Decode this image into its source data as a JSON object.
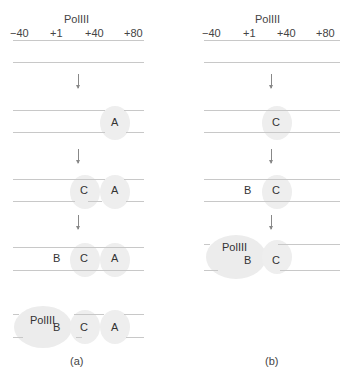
{
  "panels": [
    {
      "id": "a",
      "title": "PolIII",
      "ticks": [
        "−40",
        "+1",
        "+40",
        "+80"
      ],
      "caption": "(a)",
      "steps": [
        {
          "factors": []
        },
        {
          "factors": [
            "A"
          ]
        },
        {
          "factors": [
            "C",
            "A"
          ]
        },
        {
          "factors": [
            "B",
            "C",
            "A"
          ]
        },
        {
          "factors": [
            "PolIII",
            "B",
            "C",
            "A"
          ]
        }
      ]
    },
    {
      "id": "b",
      "title": "PolIII",
      "ticks": [
        "−40",
        "+1",
        "+40",
        "+80"
      ],
      "caption": "(b)",
      "steps": [
        {
          "factors": []
        },
        {
          "factors": [
            "C"
          ]
        },
        {
          "factors": [
            "B",
            "C"
          ]
        },
        {
          "factors": [
            "PolIII",
            "B",
            "C"
          ]
        }
      ]
    }
  ],
  "labels": {
    "a_title": "PolIII",
    "b_title": "PolIII",
    "tick_m40": "−40",
    "tick_p1": "+1",
    "tick_p40": "+40",
    "tick_p80": "+80",
    "A": "A",
    "B": "B",
    "C": "C",
    "pol": "PolIII",
    "caption_a": "(a)",
    "caption_b": "(b)"
  },
  "colors": {
    "line": "#c8c8c8",
    "blob": "#eeeeee",
    "text": "#333333"
  }
}
